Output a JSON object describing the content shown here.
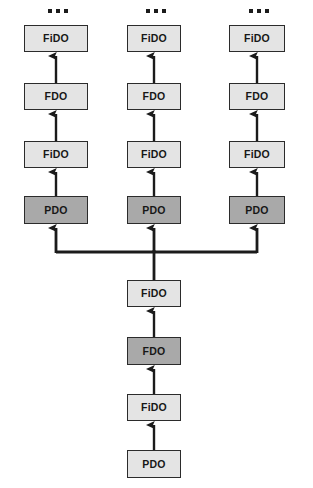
{
  "diagram": {
    "colors": {
      "background": "#ffffff",
      "box_border": "#2b2b2b",
      "box_fill_light": "#e4e4e4",
      "box_fill_dark": "#a9a9a9",
      "connector": "#1b1b1b",
      "text": "#171717"
    },
    "ellipsis": {
      "label": "...",
      "dot_count": 3
    },
    "branches": [
      {
        "name": "left-branch",
        "center_x": 56,
        "ellipsis_y": 11,
        "nodes": [
          {
            "label": "FiDO",
            "fill": "light",
            "x": 24,
            "y": 25,
            "w": 64,
            "h": 27
          },
          {
            "label": "FDO",
            "fill": "light",
            "x": 24,
            "y": 83,
            "w": 64,
            "h": 27
          },
          {
            "label": "FiDO",
            "fill": "light",
            "x": 24,
            "y": 141,
            "w": 64,
            "h": 27
          },
          {
            "label": "PDO",
            "fill": "dark",
            "x": 24,
            "y": 196,
            "w": 64,
            "h": 28
          }
        ]
      },
      {
        "name": "middle-branch",
        "center_x": 154,
        "ellipsis_y": 11,
        "nodes": [
          {
            "label": "FiDO",
            "fill": "light",
            "x": 127,
            "y": 25,
            "w": 54,
            "h": 27
          },
          {
            "label": "FDO",
            "fill": "light",
            "x": 127,
            "y": 83,
            "w": 54,
            "h": 27
          },
          {
            "label": "FiDO",
            "fill": "light",
            "x": 127,
            "y": 141,
            "w": 54,
            "h": 27
          },
          {
            "label": "PDO",
            "fill": "dark",
            "x": 127,
            "y": 196,
            "w": 54,
            "h": 28
          }
        ]
      },
      {
        "name": "right-branch",
        "center_x": 257,
        "ellipsis_y": 11,
        "nodes": [
          {
            "label": "FiDO",
            "fill": "light",
            "x": 229,
            "y": 25,
            "w": 56,
            "h": 27
          },
          {
            "label": "FDO",
            "fill": "light",
            "x": 229,
            "y": 83,
            "w": 56,
            "h": 27
          },
          {
            "label": "FiDO",
            "fill": "light",
            "x": 229,
            "y": 141,
            "w": 56,
            "h": 27
          },
          {
            "label": "PDO",
            "fill": "dark",
            "x": 229,
            "y": 196,
            "w": 56,
            "h": 28
          }
        ]
      }
    ],
    "trunk": {
      "name": "trunk-chain",
      "center_x": 154,
      "nodes": [
        {
          "label": "FiDO",
          "fill": "light",
          "x": 127,
          "y": 280,
          "w": 54,
          "h": 27
        },
        {
          "label": "FDO",
          "fill": "dark",
          "x": 127,
          "y": 337,
          "w": 54,
          "h": 28
        },
        {
          "label": "FiDO",
          "fill": "light",
          "x": 127,
          "y": 394,
          "w": 54,
          "h": 27
        },
        {
          "label": "PDO",
          "fill": "light",
          "x": 127,
          "y": 450,
          "w": 54,
          "h": 28
        }
      ]
    },
    "bus": {
      "name": "fan-out-bus",
      "y": 252,
      "x_left": 56,
      "x_right": 257,
      "riser_top": 232,
      "trunk_x": 154,
      "trunk_from_y": 280
    }
  }
}
